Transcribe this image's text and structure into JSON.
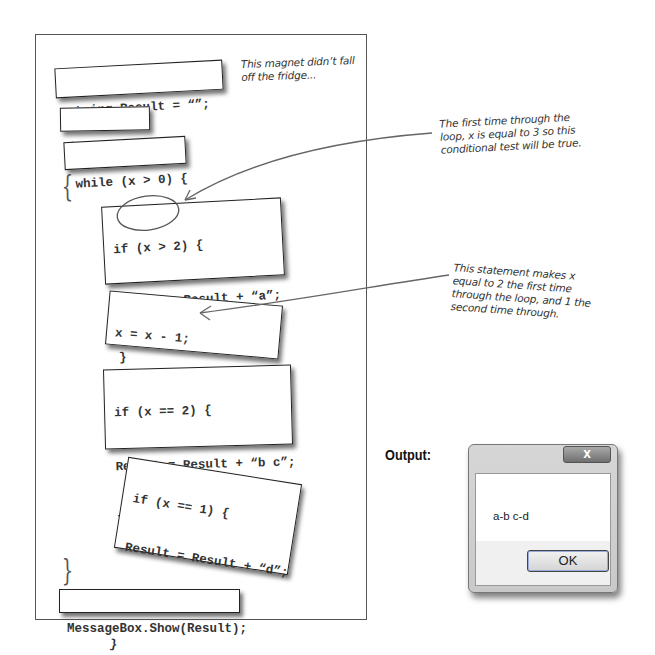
{
  "fridge": {
    "magnets": [
      {
        "id": "string-result",
        "lines": [
          "string Result = “”;"
        ]
      },
      {
        "id": "int-x",
        "lines": [
          "int x = 3;"
        ]
      },
      {
        "id": "while-loop",
        "lines": [
          "while (x > 0) {"
        ]
      },
      {
        "id": "if-x-gt-2",
        "lines": [
          "if (x > 2) {",
          "Result = Result + “a”;",
          "}"
        ]
      },
      {
        "id": "decrement",
        "lines": [
          "x = x - 1;",
          "Result = Result + “-”;"
        ]
      },
      {
        "id": "if-x-eq-2",
        "lines": [
          "if (x == 2) {",
          "Result = Result + “b c”;",
          "}"
        ]
      },
      {
        "id": "if-x-eq-1",
        "lines": [
          "if (x == 1) {",
          "Result = Result + “d”;",
          "x = x - 1;",
          "}"
        ]
      },
      {
        "id": "messagebox",
        "lines": [
          "MessageBox.Show(Result);"
        ]
      }
    ],
    "open_brace": "{",
    "close_brace": "}"
  },
  "annotations": {
    "fridge_note": [
      "This magnet didn’t fall",
      "off the fridge..."
    ],
    "first_time_note": [
      "The first time through the",
      "loop, x is equal to 3 so this",
      "conditional test will be true."
    ],
    "statement_note": [
      "This statement makes x",
      "equal to 2 the first time",
      "through the loop, and 1 the",
      "second time through."
    ]
  },
  "output": {
    "label": "Output:",
    "dialog": {
      "close_label": "X",
      "message": "a-b c-d",
      "ok_label": "OK"
    }
  }
}
